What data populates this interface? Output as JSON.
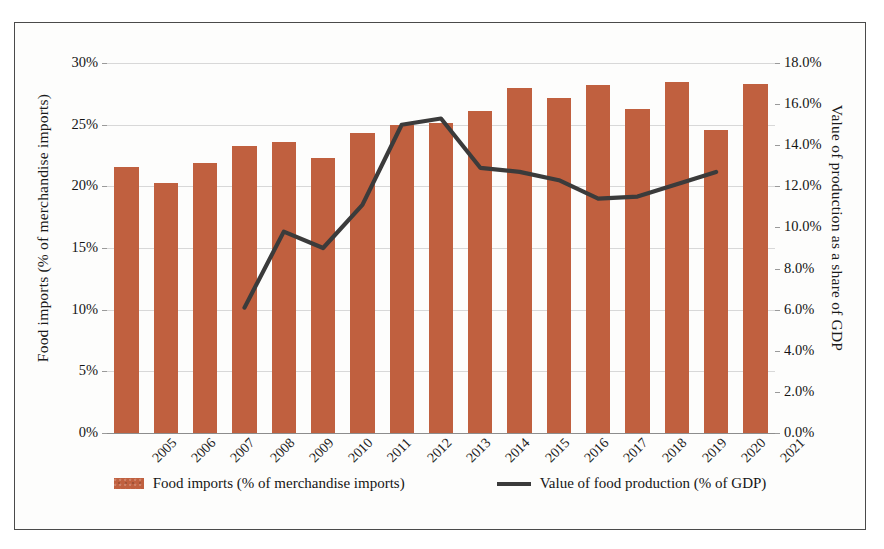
{
  "chart_data": {
    "type": "bar",
    "title": "",
    "subtitle": "",
    "xlabel": "",
    "categories": [
      "2005",
      "2006",
      "2007",
      "2008",
      "2009",
      "2010",
      "2011",
      "2012",
      "2013",
      "2014",
      "2015",
      "2016",
      "2017",
      "2018",
      "2019",
      "2020",
      "2021"
    ],
    "grid": true,
    "legend_position": "bottom",
    "axes": {
      "left": {
        "label": "Food imports (% of merchandise imports)",
        "ticks": [
          "0%",
          "5%",
          "10%",
          "15%",
          "20%",
          "25%",
          "30%"
        ],
        "tick_values": [
          0,
          5,
          10,
          15,
          20,
          25,
          30
        ],
        "ylim": [
          0,
          30
        ]
      },
      "right": {
        "label": "Value of production as a share of GDP",
        "ticks": [
          "0.0%",
          "2.0%",
          "4.0%",
          "6.0%",
          "8.0%",
          "10.0%",
          "12.0%",
          "14.0%",
          "16.0%",
          "18.0%"
        ],
        "tick_values": [
          0,
          2,
          4,
          6,
          8,
          10,
          12,
          14,
          16,
          18
        ],
        "ylim": [
          0,
          18
        ]
      }
    },
    "series": [
      {
        "name": "Food imports (% of merchandise imports)",
        "type": "bar",
        "axis": "left",
        "color": "#c0603f",
        "values": [
          21.6,
          20.3,
          21.9,
          23.3,
          23.6,
          22.3,
          24.3,
          25.0,
          25.1,
          26.1,
          28.0,
          27.2,
          28.2,
          26.3,
          28.5,
          24.6,
          28.3
        ]
      },
      {
        "name": "Value of food production (% of GDP)",
        "type": "line",
        "axis": "right",
        "color": "#3b3b3b",
        "values": [
          null,
          null,
          null,
          6.1,
          9.8,
          9.0,
          11.1,
          15.0,
          15.3,
          12.9,
          12.7,
          12.3,
          11.4,
          11.5,
          12.1,
          12.7,
          null
        ]
      }
    ]
  },
  "legend": {
    "entries": [
      {
        "label": "Food imports (% of merchandise imports)",
        "marker": "bar-swatch"
      },
      {
        "label": "Value of food production (% of GDP)",
        "marker": "line-swatch"
      }
    ]
  }
}
